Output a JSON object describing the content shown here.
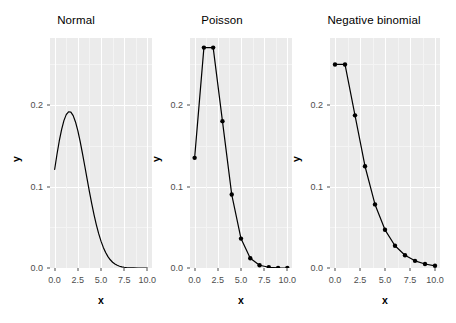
{
  "figure": {
    "axis_titles": {
      "x": "x",
      "y": "y"
    },
    "y_ticks": [
      "0.0",
      "0.1",
      "0.2"
    ],
    "x_ticks": [
      "0.0",
      "2.5",
      "5.0",
      "7.5",
      "10.0"
    ],
    "colors": {
      "panel_background": "#ebebeb",
      "grid_major": "#ffffff",
      "grid_minor": "#f4f4f4",
      "series": "#000000",
      "tick_text": "#4d4d4d",
      "title_text": "#000000",
      "page_background": "#ffffff"
    }
  },
  "chart_data": [
    {
      "type": "line",
      "title": "Normal",
      "xlabel": "x",
      "ylabel": "y",
      "xlim": [
        -0.5,
        10.5
      ],
      "ylim": [
        0.0,
        0.2825
      ],
      "xticks": [
        0.0,
        2.5,
        5.0,
        7.5,
        10.0
      ],
      "yticks": [
        0.0,
        0.1,
        0.2
      ],
      "grid": true,
      "legend": "none",
      "markers": false,
      "x": [
        0.0,
        0.25,
        0.5,
        0.75,
        1.0,
        1.25,
        1.5,
        1.75,
        2.0,
        2.25,
        2.5,
        2.75,
        3.0,
        3.25,
        3.5,
        3.75,
        4.0,
        4.25,
        4.5,
        4.75,
        5.0,
        5.25,
        5.5,
        5.75,
        6.0,
        6.25,
        6.5,
        6.75,
        7.0,
        7.25,
        7.5,
        7.75,
        8.0,
        8.5,
        9.0,
        9.5,
        10.0
      ],
      "y": [
        0.121,
        0.1394,
        0.156,
        0.17,
        0.181,
        0.1884,
        0.1919,
        0.1915,
        0.1872,
        0.1794,
        0.1687,
        0.1556,
        0.1409,
        0.1253,
        0.1094,
        0.0938,
        0.079,
        0.0653,
        0.053,
        0.0422,
        0.033,
        0.0253,
        0.019,
        0.014,
        0.0101,
        0.0071,
        0.0049,
        0.0033,
        0.0022,
        0.0014,
        0.0009,
        0.0005,
        0.0003,
        0.0001,
        0.0,
        0.0,
        0.0
      ]
    },
    {
      "type": "line",
      "title": "Poisson",
      "xlabel": "x",
      "ylabel": "y",
      "xlim": [
        -0.5,
        10.5
      ],
      "ylim": [
        0.0,
        0.2825
      ],
      "xticks": [
        0.0,
        2.5,
        5.0,
        7.5,
        10.0
      ],
      "yticks": [
        0.0,
        0.1,
        0.2
      ],
      "grid": true,
      "legend": "none",
      "markers": true,
      "x": [
        0,
        1,
        2,
        3,
        4,
        5,
        6,
        7,
        8,
        9,
        10
      ],
      "y": [
        0.1353,
        0.2707,
        0.2707,
        0.1804,
        0.0902,
        0.0361,
        0.012,
        0.0034,
        0.0009,
        0.0002,
        0.0
      ]
    },
    {
      "type": "line",
      "title": "Negative binomial",
      "xlabel": "x",
      "ylabel": "y",
      "xlim": [
        -0.5,
        10.5
      ],
      "ylim": [
        0.0,
        0.2825
      ],
      "xticks": [
        0.0,
        2.5,
        5.0,
        7.5,
        10.0
      ],
      "yticks": [
        0.0,
        0.1,
        0.2
      ],
      "grid": true,
      "legend": "none",
      "markers": true,
      "x": [
        0,
        1,
        2,
        3,
        4,
        5,
        6,
        7,
        8,
        9,
        10
      ],
      "y": [
        0.25,
        0.25,
        0.1875,
        0.125,
        0.0781,
        0.0469,
        0.0273,
        0.0156,
        0.0088,
        0.0049,
        0.0027
      ]
    }
  ]
}
